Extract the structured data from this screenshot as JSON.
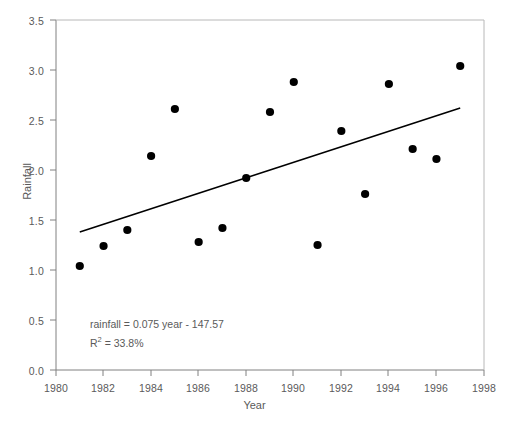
{
  "chart_data": {
    "type": "scatter",
    "title": "",
    "xlabel": "Year",
    "ylabel": "Rainfall",
    "xlim": [
      1980,
      1998
    ],
    "ylim": [
      0.0,
      3.5
    ],
    "grid": false,
    "legend": "none",
    "x_ticks": [
      1980,
      1982,
      1984,
      1986,
      1988,
      1990,
      1992,
      1994,
      1996,
      1998
    ],
    "y_ticks": [
      "0.0",
      "0.5",
      "1.0",
      "1.5",
      "2.0",
      "2.5",
      "3.0",
      "3.5"
    ],
    "x": [
      1981,
      1982,
      1983,
      1984,
      1985,
      1986,
      1987,
      1988,
      1989,
      1990,
      1991,
      1992,
      1993,
      1994,
      1995,
      1996,
      1997
    ],
    "values": [
      1.04,
      1.24,
      1.4,
      2.14,
      2.61,
      1.28,
      1.42,
      1.92,
      2.58,
      2.88,
      1.25,
      2.39,
      1.76,
      2.86,
      2.21,
      2.11,
      3.04
    ],
    "series": [
      {
        "name": "Rainfall",
        "marker": "filled-circle",
        "marker_color": "#000000",
        "points": [
          {
            "x": 1981,
            "y": 1.04
          },
          {
            "x": 1982,
            "y": 1.24
          },
          {
            "x": 1983,
            "y": 1.4
          },
          {
            "x": 1984,
            "y": 2.14
          },
          {
            "x": 1985,
            "y": 2.61
          },
          {
            "x": 1986,
            "y": 1.28
          },
          {
            "x": 1987,
            "y": 1.42
          },
          {
            "x": 1988,
            "y": 1.92
          },
          {
            "x": 1989,
            "y": 2.58
          },
          {
            "x": 1990,
            "y": 2.88
          },
          {
            "x": 1991,
            "y": 1.25
          },
          {
            "x": 1992,
            "y": 2.39
          },
          {
            "x": 1993,
            "y": 1.76
          },
          {
            "x": 1994,
            "y": 2.86
          },
          {
            "x": 1995,
            "y": 2.21
          },
          {
            "x": 1996,
            "y": 2.11
          },
          {
            "x": 1997,
            "y": 3.04
          }
        ]
      }
    ],
    "trendline": {
      "name": "regression-line",
      "color": "#000000",
      "slope": 0.075,
      "intercept": -147.57,
      "x_start": 1981,
      "y_start": 1.38,
      "x_end": 1997,
      "y_end": 2.62
    },
    "annotations": {
      "equation": "rainfall = 0.075 year - 147.57",
      "r_squared_prefix": "R",
      "r_squared_exponent": "2",
      "r_squared_value": " = 33.8%"
    },
    "colors": {
      "axis": "#808080",
      "marker": "#000000",
      "trendline": "#000000",
      "text": "#5a5a5a",
      "background": "#ffffff"
    }
  }
}
